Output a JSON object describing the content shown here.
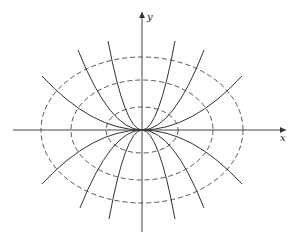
{
  "figure": {
    "axes": {
      "x_label": "x",
      "y_label": "y",
      "origin_px": [
        142,
        130
      ]
    },
    "ellipses": [
      {
        "rx": 36,
        "ry": 23
      },
      {
        "rx": 71,
        "ry": 50
      },
      {
        "rx": 101,
        "ry": 73
      }
    ],
    "parabolas": [
      {
        "end": [
          -100,
          -54
        ]
      },
      {
        "end": [
          -64,
          -80
        ]
      },
      {
        "end": [
          -34,
          -89
        ]
      },
      {
        "end": [
          33,
          -89
        ]
      },
      {
        "end": [
          62,
          -80
        ]
      },
      {
        "end": [
          100,
          -54
        ]
      },
      {
        "end": [
          -100,
          54
        ]
      },
      {
        "end": [
          -62,
          78
        ]
      },
      {
        "end": [
          -33,
          89
        ]
      },
      {
        "end": [
          33,
          89
        ]
      },
      {
        "end": [
          62,
          78
        ]
      },
      {
        "end": [
          100,
          54
        ]
      }
    ],
    "colors": {
      "axis": "#444444",
      "ellipse": "#555555",
      "parabola": "#333333"
    }
  }
}
